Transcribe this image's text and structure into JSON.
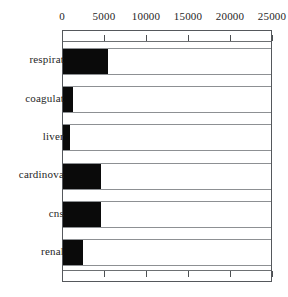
{
  "chart_data": {
    "type": "bar",
    "orientation": "horizontal",
    "title": "",
    "subtitle": "",
    "xlabel": "",
    "ylabel": "",
    "categories": [
      "respirat",
      "coagulat",
      "liver",
      "cardinova",
      "cns",
      "renal"
    ],
    "values": [
      5400,
      1200,
      850,
      4500,
      4500,
      2400
    ],
    "series": [
      {
        "name": "count",
        "values": [
          5400,
          1200,
          850,
          4500,
          4500,
          2400
        ]
      }
    ],
    "xlim": [
      0,
      25000
    ],
    "ylim": null,
    "xticks": [
      0,
      5000,
      10000,
      15000,
      20000,
      25000
    ],
    "xtick_labels": [
      "0",
      "5000",
      "10000",
      "15000",
      "20000",
      "25000"
    ],
    "xaxis_position": "top",
    "grid": false,
    "legend": null,
    "legend_position": "none",
    "annotations": [],
    "bar_color": "#0a0a0a",
    "frame_color": "#55585c",
    "row_separator_color": "#8d9093",
    "background": "#ffffff"
  },
  "axis": {
    "tick_labels": [
      "0",
      "5000",
      "10000",
      "15000",
      "20000",
      "25000"
    ]
  },
  "rows": [
    {
      "label": "respirat",
      "value": 5400
    },
    {
      "label": "coagulat",
      "value": 1200
    },
    {
      "label": "liver",
      "value": 850
    },
    {
      "label": "cardinova",
      "value": 4500
    },
    {
      "label": "cns",
      "value": 4500
    },
    {
      "label": "renal",
      "value": 2400
    }
  ]
}
